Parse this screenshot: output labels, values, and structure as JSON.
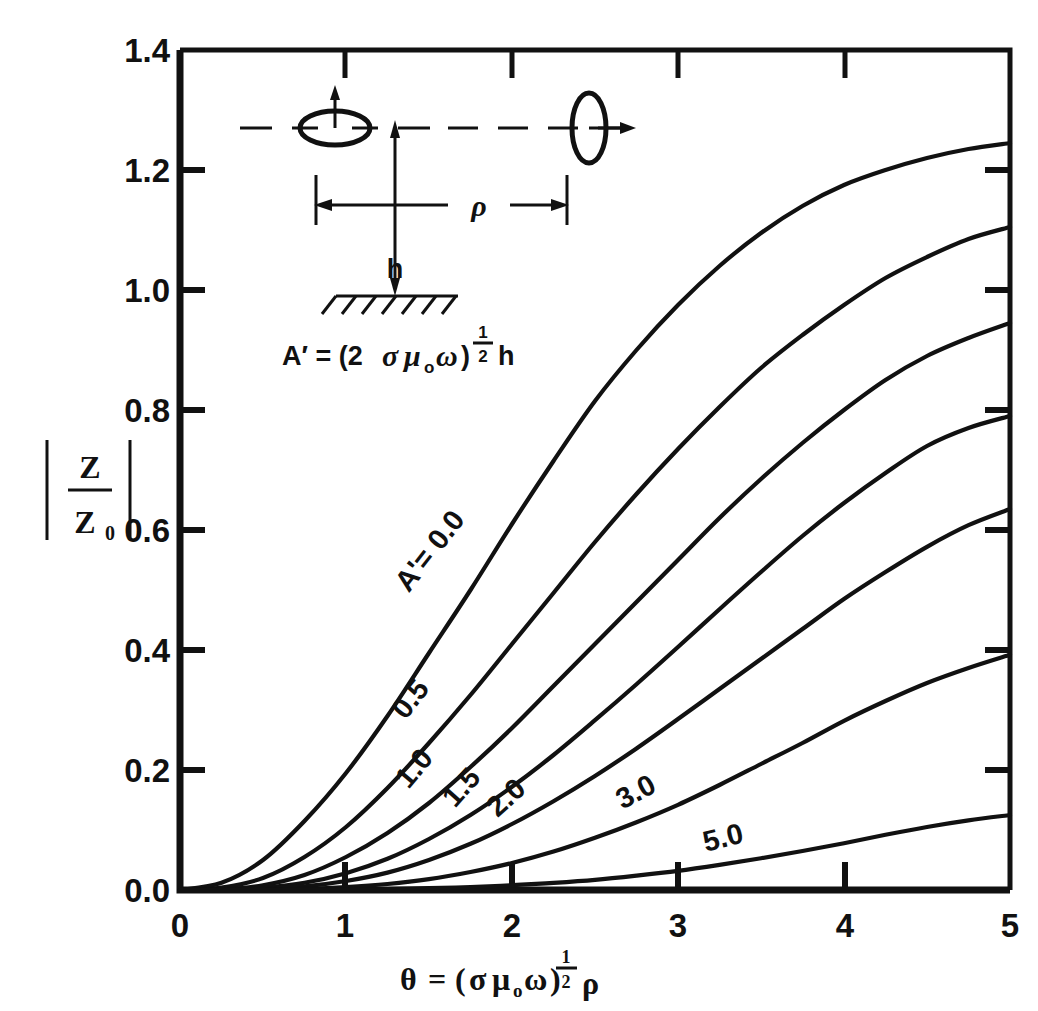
{
  "chart_data": {
    "type": "line",
    "title": "",
    "xlabel": "θ = (σμ₀ω)^½ ρ",
    "ylabel": "|Z/Z₀|",
    "xlim": [
      0,
      5
    ],
    "ylim": [
      0,
      1.4
    ],
    "grid": false,
    "legend_position": "inline-curve-labels",
    "x_ticks": [
      "0",
      "1",
      "2",
      "3",
      "4",
      "5"
    ],
    "y_ticks": [
      "0.0",
      "0.2",
      "0.4",
      "0.6",
      "0.8",
      "1.0",
      "1.2",
      "1.4"
    ],
    "x": [
      0,
      0.25,
      0.5,
      0.75,
      1,
      1.25,
      1.5,
      1.75,
      2,
      2.25,
      2.5,
      2.75,
      3,
      3.25,
      3.5,
      3.75,
      4,
      4.25,
      4.5,
      4.75,
      5
    ],
    "series": [
      {
        "name": "A' = 0.0",
        "label": "A'= 0.0",
        "values": [
          0.0,
          0.012,
          0.05,
          0.115,
          0.195,
          0.29,
          0.395,
          0.5,
          0.61,
          0.715,
          0.815,
          0.9,
          0.975,
          1.04,
          1.095,
          1.14,
          1.175,
          1.2,
          1.22,
          1.235,
          1.245
        ]
      },
      {
        "name": "A' = 0.5",
        "label": "0.5",
        "values": [
          0.0,
          0.004,
          0.02,
          0.055,
          0.105,
          0.17,
          0.245,
          0.325,
          0.41,
          0.495,
          0.58,
          0.66,
          0.735,
          0.805,
          0.87,
          0.925,
          0.975,
          1.02,
          1.055,
          1.085,
          1.105
        ]
      },
      {
        "name": "A' = 1.0",
        "label": "1.0",
        "values": [
          0.0,
          0.001,
          0.008,
          0.025,
          0.055,
          0.095,
          0.145,
          0.205,
          0.27,
          0.34,
          0.41,
          0.48,
          0.55,
          0.62,
          0.685,
          0.745,
          0.8,
          0.85,
          0.89,
          0.92,
          0.945
        ]
      },
      {
        "name": "A' = 1.5",
        "label": "1.5",
        "values": [
          0.0,
          0.0005,
          0.004,
          0.012,
          0.028,
          0.052,
          0.085,
          0.125,
          0.172,
          0.225,
          0.283,
          0.343,
          0.405,
          0.468,
          0.53,
          0.59,
          0.645,
          0.695,
          0.74,
          0.77,
          0.79
        ]
      },
      {
        "name": "A' = 2.0",
        "label": "2.0",
        "values": [
          0.0,
          0.0002,
          0.002,
          0.006,
          0.015,
          0.029,
          0.05,
          0.077,
          0.11,
          0.148,
          0.19,
          0.236,
          0.285,
          0.335,
          0.385,
          0.435,
          0.485,
          0.53,
          0.572,
          0.608,
          0.635
        ]
      },
      {
        "name": "A' = 3.0",
        "label": "3.0",
        "values": [
          0.0,
          0.0,
          0.0005,
          0.002,
          0.005,
          0.01,
          0.018,
          0.03,
          0.045,
          0.064,
          0.087,
          0.113,
          0.142,
          0.175,
          0.21,
          0.245,
          0.282,
          0.315,
          0.345,
          0.37,
          0.392
        ]
      },
      {
        "name": "A' = 5.0",
        "label": "5.0",
        "values": [
          0.0,
          0.0,
          0.0,
          0.0002,
          0.0006,
          0.0014,
          0.003,
          0.005,
          0.008,
          0.012,
          0.017,
          0.024,
          0.032,
          0.042,
          0.053,
          0.065,
          0.078,
          0.092,
          0.105,
          0.116,
          0.125
        ]
      }
    ]
  },
  "inset": {
    "formula": "A' = (2 σμ₀ω)^½ h",
    "formula_parts": {
      "lhs": "A′ = (2",
      "sigma": "σ",
      "mu": "μ",
      "mu_sub": "o",
      "omega": "ω",
      "paren_close": ")",
      "exp_num": "1",
      "exp_den": "2",
      "h": "h"
    },
    "distance_label": "ρ",
    "height_label": "h",
    "left_loop_name": "horizontal-loop-antenna",
    "right_loop_name": "vertical-loop-antenna",
    "ground_name": "hatched-ground-plane"
  },
  "axis": {
    "x_title_parts": {
      "theta": "θ",
      "equals": "=",
      "open": "(",
      "sigma": "σ",
      "mu": "μ",
      "mu_sub": "o",
      "omega": "ω",
      "close": ")",
      "exp_num": "1",
      "exp_den": "2",
      "rho": "ρ"
    },
    "y_title_parts": {
      "bar": "|",
      "num": "Z",
      "den": "Z",
      "den_sub": "0"
    }
  },
  "colors": {
    "ink": "#111111",
    "background": "#ffffff"
  }
}
